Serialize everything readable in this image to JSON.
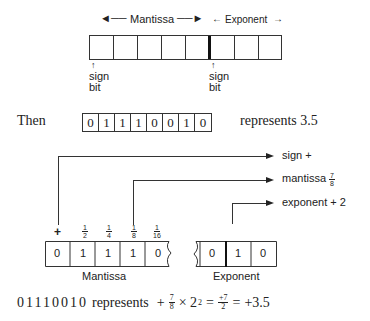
{
  "top_register": {
    "mantissa_label": "Mantissa",
    "exponent_label": "Exponent",
    "left_arrow": "←",
    "right_arrow": "→",
    "cells": 8,
    "mantissa_cells": 5,
    "exponent_cells": 3,
    "sign_bit_mantissa": {
      "arrow": "↑",
      "line1": "sign",
      "line2": "bit"
    },
    "sign_bit_exponent": {
      "arrow": "↑",
      "line1": "sign",
      "line2": "bit"
    }
  },
  "example": {
    "prefix": "Then",
    "bits": [
      "0",
      "1",
      "1",
      "1",
      "0",
      "0",
      "1",
      "0"
    ],
    "suffix": "represents 3.5"
  },
  "breakdown": {
    "bit_weights": [
      {
        "label": "+"
      },
      {
        "num": "1",
        "den": "2"
      },
      {
        "num": "1",
        "den": "4"
      },
      {
        "num": "1",
        "den": "8"
      },
      {
        "num": "1",
        "den": "16"
      }
    ],
    "mantissa_bits": [
      "0",
      "1",
      "1",
      "1",
      "0"
    ],
    "exponent_bits": [
      "0",
      "1",
      "0"
    ],
    "mantissa_label": "Mantissa",
    "exponent_label": "Exponent",
    "callouts": [
      {
        "label": "sign +"
      },
      {
        "label": "mantissa",
        "frac_num": "7",
        "frac_den": "8"
      },
      {
        "label": "exponent + 2"
      }
    ]
  },
  "formula": {
    "bits": "01110010",
    "text": "represents",
    "expr_plus": "+",
    "frac1_num": "7",
    "frac1_den": "8",
    "times": "× 2",
    "power": "2",
    "eq1": "=",
    "frac2_num": "+7",
    "frac2_den": "2",
    "eq2": "=",
    "result": "+3.5"
  }
}
